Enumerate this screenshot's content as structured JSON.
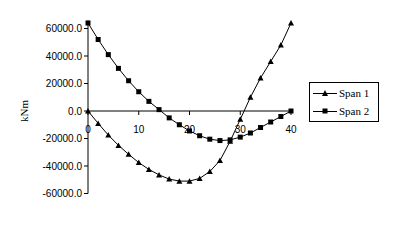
{
  "chart_data": {
    "type": "line",
    "title": "",
    "xlabel": "",
    "ylabel": "kNm",
    "xlim": [
      0,
      40
    ],
    "ylim": [
      -60000,
      60000
    ],
    "x_ticks": [
      0,
      10,
      20,
      30,
      40
    ],
    "y_ticks": [
      60000,
      40000,
      20000,
      0,
      -20000,
      -40000,
      -60000
    ],
    "y_tick_labels": [
      "60000.0",
      "40000.0",
      "20000.0",
      "0.0",
      "-20000.0",
      "-40000.0",
      "-60000.0"
    ],
    "x_tick_labels": [
      "0",
      "10",
      "20",
      "30",
      "40"
    ],
    "grid": false,
    "legend_position": "right",
    "x": [
      0,
      2,
      4,
      6,
      8,
      10,
      12,
      14,
      16,
      18,
      20,
      22,
      24,
      26,
      28,
      30,
      32,
      34,
      36,
      38,
      40
    ],
    "series": [
      {
        "name": "Span 1",
        "marker": "triangle",
        "values": [
          0,
          -9000,
          -17500,
          -25000,
          -31500,
          -37500,
          -42500,
          -46500,
          -49500,
          -51000,
          -51000,
          -49000,
          -44000,
          -36000,
          -22000,
          -6000,
          10000,
          24000,
          36000,
          48000,
          64000
        ]
      },
      {
        "name": "Span 2",
        "marker": "square",
        "values": [
          64000,
          52000,
          41000,
          31000,
          22000,
          14000,
          7000,
          1000,
          -5000,
          -10000,
          -14500,
          -18000,
          -20500,
          -21500,
          -21000,
          -19000,
          -16000,
          -12000,
          -8000,
          -4000,
          0
        ]
      }
    ]
  },
  "legend": {
    "items": [
      {
        "label": "Span 1"
      },
      {
        "label": "Span 2"
      }
    ]
  },
  "axes": {
    "ylabel": "kNm"
  }
}
